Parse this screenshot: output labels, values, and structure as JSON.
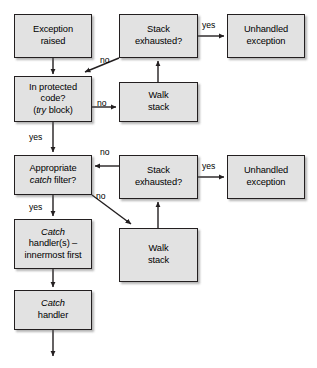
{
  "diagram": {
    "canvas": {
      "width": 317,
      "height": 368
    },
    "style": {
      "node_fill": "#e2e2e2",
      "node_border": "#231f20",
      "background": "#ffffff",
      "line_color": "#231f20"
    },
    "nodes": [
      {
        "id": "exception-raised",
        "label": "Exception\nraised",
        "line1": "Exception",
        "line2": "raised",
        "x": 14,
        "y": 14,
        "w": 78,
        "h": 44
      },
      {
        "id": "stack-exhausted-1",
        "label": "Stack\nexhausted?",
        "line1": "Stack",
        "line2": "exhausted?",
        "x": 119,
        "y": 14,
        "w": 79,
        "h": 44
      },
      {
        "id": "unhandled-exception-1",
        "label": "Unhandled\nexception",
        "line1": "Unhandled",
        "line2": "exception",
        "x": 227,
        "y": 14,
        "w": 78,
        "h": 44
      },
      {
        "id": "in-protected-code",
        "label": "In protected\ncode?\n(try block)",
        "line1": "In protected",
        "line2": "code?",
        "line3_pre": "(",
        "line3_em": "try",
        "line3_post": " block)",
        "x": 14,
        "y": 76,
        "w": 78,
        "h": 46
      },
      {
        "id": "walk-stack-1",
        "label": "Walk\nstack",
        "line1": "Walk",
        "line2": "stack",
        "x": 119,
        "y": 82,
        "w": 79,
        "h": 40
      },
      {
        "id": "appropriate-catch-filter",
        "label": "Appropriate\ncatch filter?",
        "line1": "Appropriate",
        "line2_em": "catch",
        "line2_post": " filter?",
        "x": 14,
        "y": 155,
        "w": 78,
        "h": 40
      },
      {
        "id": "stack-exhausted-2",
        "label": "Stack\nexhausted?",
        "line1": "Stack",
        "line2": "exhausted?",
        "x": 119,
        "y": 155,
        "w": 79,
        "h": 44
      },
      {
        "id": "unhandled-exception-2",
        "label": "Unhandled\nexception",
        "line1": "Unhandled",
        "line2": "exception",
        "x": 227,
        "y": 155,
        "w": 78,
        "h": 44
      },
      {
        "id": "catch-handlers-innermost",
        "label": "Catch\nhandler(s) –\ninnermost first",
        "line1_em": "Catch",
        "line2": "handler(s) –",
        "line3": "innermost first",
        "x": 14,
        "y": 219,
        "w": 78,
        "h": 50
      },
      {
        "id": "walk-stack-2",
        "label": "Walk\nstack",
        "line1": "Walk",
        "line2": "stack",
        "x": 119,
        "y": 228,
        "w": 79,
        "h": 54
      },
      {
        "id": "catch-handler",
        "label": "Catch\nhandler",
        "line1_em": "Catch",
        "line2": "handler",
        "x": 14,
        "y": 290,
        "w": 78,
        "h": 40
      }
    ],
    "edge_labels": [
      {
        "id": "yes-stack1-unhandled",
        "text": "yes",
        "x": 202,
        "y": 21
      },
      {
        "id": "no-stack1-protected",
        "text": "no",
        "x": 100,
        "y": 56
      },
      {
        "id": "no-protected-walk",
        "text": "no",
        "x": 97,
        "y": 99
      },
      {
        "id": "yes-protected-filter",
        "text": "yes",
        "x": 29,
        "y": 133
      },
      {
        "id": "no-stack2-filter",
        "text": "no",
        "x": 100,
        "y": 148
      },
      {
        "id": "yes-stack2-unhandled",
        "text": "yes",
        "x": 202,
        "y": 162
      },
      {
        "id": "no-filter-walk2",
        "text": "no",
        "x": 96,
        "y": 192
      },
      {
        "id": "yes-filter-catch",
        "text": "yes",
        "x": 29,
        "y": 203
      }
    ]
  }
}
